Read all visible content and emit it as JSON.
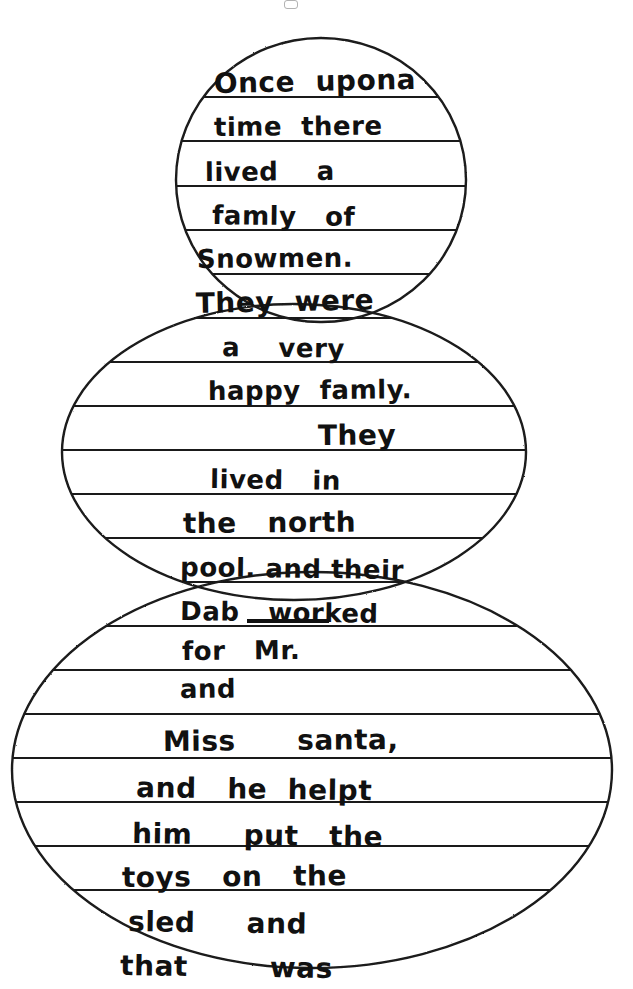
{
  "document": {
    "kind": "scanned-handwriting-worksheet",
    "title": "Snowman shaped story paper",
    "page_background": "#ffffff",
    "ink_color": "#111111",
    "rule_line_color": "#1a1a1a",
    "outline_color": "#1a1a1a",
    "width": 633,
    "height": 989
  },
  "shapes": [
    {
      "name": "snowman-head",
      "type": "circle",
      "cx": 321,
      "cy": 180,
      "rx": 145,
      "ry": 142
    },
    {
      "name": "snowman-middle-ball",
      "type": "circle",
      "cx": 294,
      "cy": 452,
      "rx": 232,
      "ry": 148
    },
    {
      "name": "snowman-bottom-ball",
      "type": "circle",
      "cx": 312,
      "cy": 770,
      "rx": 300,
      "ry": 198
    }
  ],
  "story": {
    "full_text": "Once upona time there lived a famly of Snowmen. They were a very happy famly. They lived in the north pool. and their Dab worked for Mr. and Miss santa. and he helpt him put the toys on the sled and that was",
    "lines": [
      {
        "id": "l01",
        "text": "Once  upona",
        "section": "head",
        "x": 214,
        "baseline": 96,
        "size": "s3",
        "tilt": "tilt-a"
      },
      {
        "id": "l02",
        "text": "time  there",
        "section": "head",
        "x": 214,
        "baseline": 140,
        "size": "s2",
        "tilt": "tilt-d"
      },
      {
        "id": "l03",
        "text": "lived    a",
        "section": "head",
        "x": 205,
        "baseline": 185,
        "size": "s2",
        "tilt": "tilt-d"
      },
      {
        "id": "l04",
        "text": "famly   of",
        "section": "head",
        "x": 212,
        "baseline": 228,
        "size": "s2",
        "tilt": "tilt-c"
      },
      {
        "id": "l05",
        "text": "Snowmen.",
        "section": "head",
        "x": 197,
        "baseline": 272,
        "size": "s2",
        "tilt": "tilt-d"
      },
      {
        "id": "l06",
        "text": "They  were",
        "section": "head",
        "x": 196,
        "baseline": 316,
        "size": "s3",
        "tilt": "tilt-a"
      },
      {
        "id": "l07",
        "text": "a    very",
        "section": "middle",
        "x": 222,
        "baseline": 360,
        "size": "s2",
        "tilt": "tilt-c"
      },
      {
        "id": "l08",
        "text": "happy  famly.",
        "section": "middle",
        "x": 208,
        "baseline": 404,
        "size": "s2",
        "tilt": "tilt-d"
      },
      {
        "id": "l09",
        "text": "They",
        "section": "middle",
        "x": 318,
        "baseline": 448,
        "size": "s3",
        "tilt": "tilt-d"
      },
      {
        "id": "l10",
        "text": "lived   in",
        "section": "middle",
        "x": 210,
        "baseline": 492,
        "size": "s2",
        "tilt": "tilt-c"
      },
      {
        "id": "l11",
        "text": "the   north",
        "section": "middle",
        "x": 183,
        "baseline": 536,
        "size": "s3",
        "tilt": "tilt-d"
      },
      {
        "id": "l12",
        "text": "pool. and their",
        "section": "middle",
        "x": 180,
        "baseline": 580,
        "size": "s2",
        "tilt": "tilt-c"
      },
      {
        "id": "l13",
        "text": "Dab   worked",
        "section": "middle",
        "x": 180,
        "baseline": 624,
        "size": "s2",
        "tilt": "tilt-c"
      },
      {
        "id": "l14",
        "text": "for   Mr.",
        "section": "middle",
        "x": 182,
        "baseline": 664,
        "size": "s2",
        "tilt": "tilt-d"
      },
      {
        "id": "l15",
        "text": "and",
        "section": "middle",
        "x": 180,
        "baseline": 702,
        "size": "s2",
        "tilt": "tilt-d"
      },
      {
        "id": "l16",
        "text": "Miss      santa,",
        "section": "bottom",
        "x": 163,
        "baseline": 754,
        "size": "s3",
        "tilt": "tilt-d"
      },
      {
        "id": "l17",
        "text": "and   he  helpt",
        "section": "bottom",
        "x": 136,
        "baseline": 800,
        "size": "s3",
        "tilt": "tilt-c"
      },
      {
        "id": "l18",
        "text": "him     put   the",
        "section": "bottom",
        "x": 132,
        "baseline": 846,
        "size": "s3",
        "tilt": "tilt-c"
      },
      {
        "id": "l19",
        "text": "toys   on   the",
        "section": "bottom",
        "x": 122,
        "baseline": 890,
        "size": "s3",
        "tilt": "tilt-d"
      },
      {
        "id": "l20",
        "text": "sled     and",
        "section": "bottom",
        "x": 128,
        "baseline": 934,
        "size": "s3",
        "tilt": "tilt-c"
      },
      {
        "id": "l21",
        "text": "that        was",
        "section": "bottom",
        "x": 120,
        "baseline": 978,
        "size": "s3",
        "tilt": "tilt-c"
      }
    ]
  },
  "rule_lines": {
    "spacing_px": 44,
    "y_positions": [
      97,
      141,
      186,
      230,
      274,
      318,
      362,
      406,
      450,
      494,
      538,
      582,
      626,
      670,
      714,
      758,
      802,
      846,
      890,
      934
    ]
  },
  "marks": {
    "erased_underline": {
      "name": "erased-word-strike",
      "x": 247,
      "y": 619,
      "width": 82,
      "height": 4
    },
    "top_clipped_speck": {
      "name": "clipped-mark",
      "x": 284,
      "y": 0
    }
  }
}
